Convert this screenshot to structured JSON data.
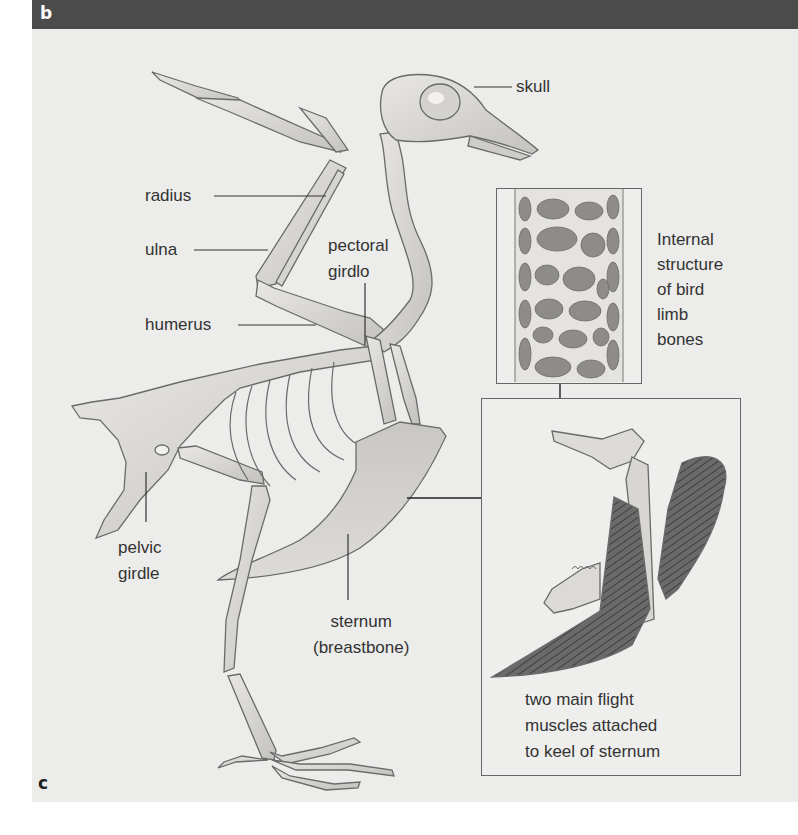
{
  "figure": {
    "panel_labels": {
      "top": "b",
      "bottom": "c"
    },
    "colors": {
      "header": "#4b4b4b",
      "background": "#ececea",
      "bone": "#dcdad6",
      "bone_outline": "#6a6a6a",
      "muscle": "#5a5a5a",
      "text": "#333333"
    }
  },
  "labels": {
    "skull": "skull",
    "radius": "radius",
    "ulna": "ulna",
    "humerus": "humerus",
    "pectoral_girdle": [
      "pectoral",
      "girdlo"
    ],
    "pelvic_girdle": [
      "pelvic",
      "girdle"
    ],
    "sternum": [
      "sternum",
      "(breastbone)"
    ]
  },
  "insets": {
    "bone_structure": {
      "caption": [
        "Internal",
        "structure",
        "of bird",
        "limb",
        "bones"
      ]
    },
    "flight_muscles": {
      "caption": [
        "two main flight",
        "muscles attached",
        "to keel of sternum"
      ]
    }
  }
}
